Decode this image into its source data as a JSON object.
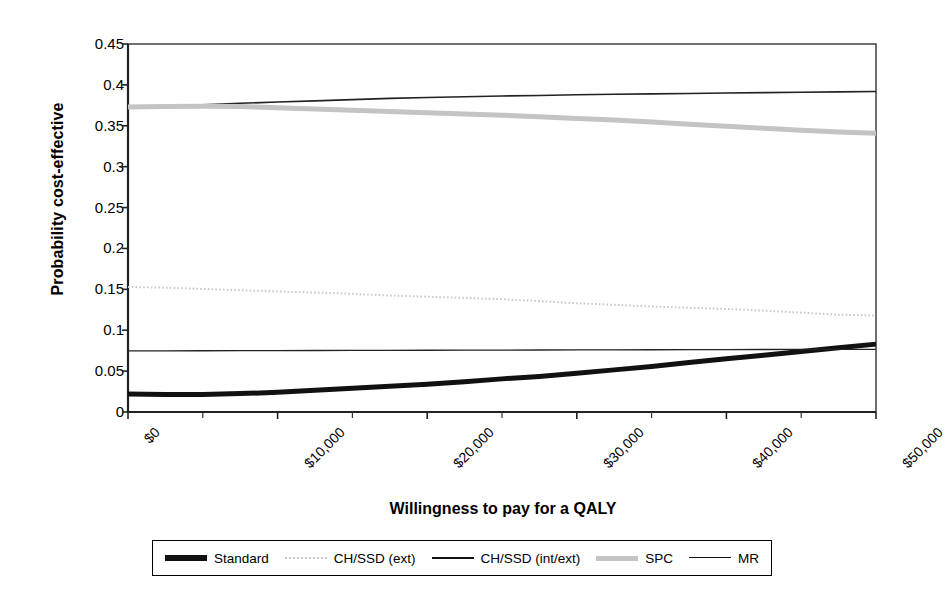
{
  "chart_data": {
    "type": "line",
    "title": "",
    "xlabel": "Willingness to pay for a QALY",
    "ylabel": "Probability cost-effective",
    "xlim": [
      0,
      50000
    ],
    "ylim": [
      0,
      0.45
    ],
    "grid": false,
    "legend_position": "bottom",
    "x_tick_labels": [
      "$0",
      "$10,000",
      "$20,000",
      "$30,000",
      "$40,000",
      "$50,000"
    ],
    "x_tick_values": [
      0,
      10000,
      20000,
      30000,
      40000,
      50000
    ],
    "x_minor_tick_values": [
      5000,
      15000,
      25000,
      35000,
      45000
    ],
    "y_tick_labels": [
      "0",
      "0.05",
      "0.1",
      "0.15",
      "0.2",
      "0.25",
      "0.3",
      "0.35",
      "0.4",
      "0.45"
    ],
    "y_tick_values": [
      0,
      0.05,
      0.1,
      0.15,
      0.2,
      0.25,
      0.3,
      0.35,
      0.4,
      0.45
    ],
    "x": [
      0,
      2500,
      5000,
      7500,
      10000,
      12500,
      15000,
      17500,
      20000,
      22500,
      25000,
      27500,
      30000,
      32500,
      35000,
      37500,
      40000,
      42500,
      45000,
      47500,
      50000
    ],
    "series": [
      {
        "name": "Standard",
        "style": "thick-solid-black",
        "color": "#111111",
        "width": 5,
        "values": [
          0.022,
          0.0215,
          0.0215,
          0.0225,
          0.024,
          0.0265,
          0.029,
          0.0315,
          0.034,
          0.037,
          0.0405,
          0.0435,
          0.0475,
          0.0515,
          0.0555,
          0.0605,
          0.065,
          0.0695,
          0.074,
          0.0785,
          0.083
        ]
      },
      {
        "name": "CH/SSD (ext)",
        "style": "dotted-light-gray",
        "color": "#c9c9c9",
        "width": 2,
        "values": [
          0.153,
          0.152,
          0.1505,
          0.149,
          0.1475,
          0.146,
          0.1445,
          0.1425,
          0.141,
          0.1395,
          0.138,
          0.1355,
          0.133,
          0.131,
          0.129,
          0.1275,
          0.126,
          0.124,
          0.1215,
          0.119,
          0.118
        ]
      },
      {
        "name": "CH/SSD (int/ext)",
        "style": "thin-solid-black",
        "color": "#222222",
        "width": 1.6,
        "values": [
          0.373,
          0.374,
          0.3755,
          0.3775,
          0.379,
          0.3805,
          0.382,
          0.3835,
          0.3845,
          0.3855,
          0.3865,
          0.387,
          0.388,
          0.3885,
          0.389,
          0.3895,
          0.39,
          0.3905,
          0.391,
          0.3915,
          0.392
        ]
      },
      {
        "name": "SPC",
        "style": "thick-solid-gray",
        "color": "#c4c4c4",
        "width": 5,
        "values": [
          0.373,
          0.3735,
          0.374,
          0.3735,
          0.372,
          0.3705,
          0.369,
          0.3675,
          0.366,
          0.3645,
          0.363,
          0.361,
          0.359,
          0.357,
          0.3545,
          0.352,
          0.3495,
          0.347,
          0.3445,
          0.3425,
          0.341
        ]
      },
      {
        "name": "MR",
        "style": "thin-solid-black",
        "color": "#222222",
        "width": 1.3,
        "values": [
          0.0748,
          0.0748,
          0.0749,
          0.075,
          0.0751,
          0.0752,
          0.0753,
          0.0754,
          0.0755,
          0.0756,
          0.0757,
          0.0758,
          0.0759,
          0.076,
          0.0761,
          0.0762,
          0.0763,
          0.0764,
          0.0765,
          0.0766,
          0.0767
        ]
      }
    ]
  },
  "legend": {
    "entries": [
      {
        "label": "Standard",
        "swatch": "sw-standard"
      },
      {
        "label": "CH/SSD (ext)",
        "swatch": "sw-chssd-ext"
      },
      {
        "label": "CH/SSD (int/ext)",
        "swatch": "sw-chssd-intext"
      },
      {
        "label": "SPC",
        "swatch": "sw-spc"
      },
      {
        "label": "MR",
        "swatch": "sw-mr"
      }
    ]
  },
  "colors": {
    "axis": "#333333",
    "plot_background": "#ffffff",
    "standard": "#111111",
    "chssd_ext": "#c9c9c9",
    "chssd_intext": "#222222",
    "spc": "#c4c4c4",
    "mr": "#222222"
  },
  "plot_geometry": {
    "left": 128,
    "right": 876,
    "top": 44,
    "bottom": 412
  }
}
